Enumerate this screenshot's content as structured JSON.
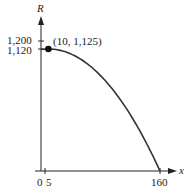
{
  "chart_data": {
    "type": "line",
    "title": "",
    "xlabel": "x",
    "ylabel": "R",
    "x_ticks": [
      "0",
      "5",
      "160"
    ],
    "y_ticks": [
      "1,200",
      "1,120"
    ],
    "series": [
      {
        "name": "R(x)",
        "function": "R = 1125 - 0.05(x - 10)^2",
        "x": [
          0,
          10,
          40,
          70,
          100,
          130,
          160
        ],
        "values": [
          1120,
          1125,
          1080,
          945,
          720,
          405,
          0
        ]
      }
    ],
    "annotations": [
      {
        "x": 10,
        "y": 1125,
        "text": "(10, 1,125)"
      }
    ],
    "xlim": [
      0,
      160
    ],
    "ylim": [
      0,
      1200
    ],
    "grid": false,
    "legend": "none"
  },
  "labels": {
    "y_axis": "R",
    "x_axis": "x",
    "tick_1200": "1,200",
    "tick_1120": "1,120",
    "tick_0": "0",
    "tick_5": "5",
    "tick_160": "160",
    "point": "(10, 1,125)"
  }
}
